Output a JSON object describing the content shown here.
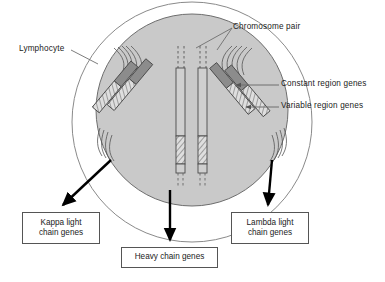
{
  "diagram": {
    "colors": {
      "nucleus_fill": "#c9c9c9",
      "cell_outline": "#7a7a7a",
      "nucleus_outline": "#6e6e6e",
      "constant_region_fill": "#8c8c8c",
      "variable_region_fill": "#d8d8d8",
      "chromosome_stroke": "#4a4a4a",
      "arrow_color": "#000000",
      "leader_color": "#6e6e6e",
      "box_border": "#555555",
      "text_color": "#1b1b1b"
    },
    "callouts": {
      "lymphocyte": "Lymphocyte",
      "chromosome_pair": "Chromosome pair",
      "constant_region_genes": "Constant region genes",
      "variable_region_genes": "Variable region genes"
    },
    "gene_boxes": {
      "kappa": {
        "line1": "Kappa light",
        "line2": "chain genes"
      },
      "heavy": {
        "line1": "Heavy chain genes"
      },
      "lambda": {
        "line1": "Lambda light",
        "line2": "chain genes"
      }
    },
    "structures": {
      "cell_membrane": "outer circle",
      "nucleus": "inner shaded circle",
      "chromosome_pairs": 3,
      "left_locus": "kappa light chain locus",
      "center_locus": "heavy chain locus",
      "right_locus": "lambda light chain locus"
    }
  }
}
